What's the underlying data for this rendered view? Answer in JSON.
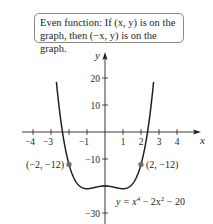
{
  "callout": {
    "line1": "Even function: If (x, y) is on the",
    "line2": "graph, then (−x, y) is on the graph."
  },
  "chart_data": {
    "type": "line",
    "title": "",
    "xlabel": "x",
    "ylabel": "y",
    "xlim": [
      -4.5,
      5.2
    ],
    "ylim": [
      -33,
      28
    ],
    "grid": false,
    "x_ticks": [
      -4,
      -3,
      -2,
      -1,
      1,
      2,
      3,
      4
    ],
    "x_tick_labels": [
      "−4",
      "−3",
      "",
      "−1",
      "1",
      "2",
      "3",
      "4"
    ],
    "y_ticks": [
      -30,
      -20,
      -10,
      10,
      20
    ],
    "y_tick_labels": [
      "−30",
      "",
      "−10",
      "10",
      "20"
    ],
    "series": [
      {
        "name": "y = x^4 − 2x^2 − 20",
        "function": "x^4 - 2x^2 - 20",
        "x": [
          -2.7,
          -2.5,
          -2.25,
          -2,
          -1.75,
          -1.5,
          -1.25,
          -1,
          -0.75,
          -0.5,
          -0.25,
          0,
          0.25,
          0.5,
          0.75,
          1,
          1.25,
          1.5,
          1.75,
          2,
          2.25,
          2.5,
          2.7
        ],
        "values": [
          20.57,
          6.56,
          -4.5,
          -12,
          -16.75,
          -19.44,
          -20.68,
          -21,
          -20.81,
          -20.44,
          -20.12,
          -20,
          -20.12,
          -20.44,
          -20.81,
          -21,
          -20.68,
          -19.44,
          -16.75,
          -12,
          -4.5,
          6.56,
          20.57
        ]
      }
    ],
    "points": [
      {
        "x": -2,
        "y": -12,
        "label": "(−2, −12)"
      },
      {
        "x": 2,
        "y": -12,
        "label": "(2, −12)"
      }
    ],
    "annotations": [
      {
        "text": "y = x⁴ − 2x² − 20",
        "at": "lower right of curve"
      },
      {
        "text": "Even function: If (x, y) is on the graph, then (−x, y) is on the graph.",
        "at": "top callout"
      }
    ]
  },
  "equation_label": {
    "lhs": "y = x",
    "exp1": "4",
    "mid": " − 2x",
    "exp2": "2",
    "rhs": " − 20"
  }
}
